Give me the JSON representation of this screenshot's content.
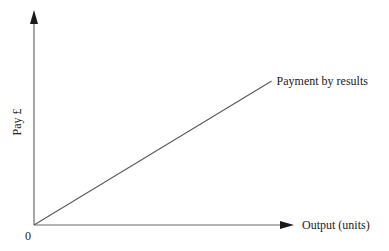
{
  "chart_data": {
    "type": "line",
    "title": "",
    "xlabel": "Output (units)",
    "ylabel": "Pay £",
    "x_ticks": [],
    "y_ticks": [],
    "origin_label": "0",
    "grid": false,
    "xlim": [
      0,
      1
    ],
    "ylim": [
      0,
      1
    ],
    "series": [
      {
        "name": "Payment by results",
        "x": [
          0,
          0.88
        ],
        "y": [
          0,
          0.67
        ],
        "label_position": "end-of-line"
      }
    ],
    "annotations": [
      "Payment by results"
    ],
    "colors": {
      "axis": "#6b6b6b",
      "line": "#5a5a5a",
      "arrow": "#1a1a1a",
      "text": "#222222"
    }
  }
}
